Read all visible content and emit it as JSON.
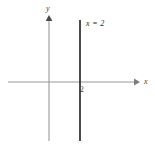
{
  "figure": {
    "type": "cartesian-plane",
    "width": 155,
    "height": 149,
    "background_color": "#ffffff"
  },
  "axes": {
    "x_axis": {
      "label": "x",
      "color": "#9a9a9a",
      "y_pixel": 82,
      "x_start": 8,
      "x_end": 138,
      "arrow": "right"
    },
    "y_axis": {
      "label": "y",
      "color": "#9a9a9a",
      "x_pixel": 49,
      "y_start": 17,
      "y_end": 141,
      "arrow": "up"
    },
    "origin": {
      "x": 49,
      "y": 82
    }
  },
  "ticks": [
    {
      "label": "2",
      "axis": "x",
      "value": 2,
      "x_pixel": 80
    }
  ],
  "graph": {
    "equation_label": "x = 2",
    "line_color": "#1f1f1f",
    "x_pixel": 80,
    "y_top": 20,
    "y_bottom": 141,
    "orientation": "vertical"
  }
}
